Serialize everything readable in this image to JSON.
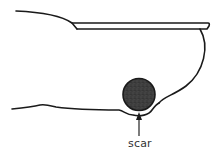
{
  "diagram": {
    "labels": {
      "scar": "scar"
    },
    "colors": {
      "line": "#1a1a1a",
      "scar_fill": "#3a3a3a",
      "background": "#ffffff",
      "label": "#333333"
    }
  }
}
